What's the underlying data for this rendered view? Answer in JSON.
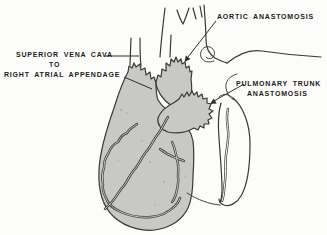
{
  "diagram": {
    "annotations": {
      "aortic": {
        "label": "AORTIC ANASTOMOSIS"
      },
      "svc": {
        "line1": "SUPERIOR VENA CAVA",
        "line2": "TO",
        "line3": "RIGHT ATRIAL APPENDAGE"
      },
      "pulmonary": {
        "line1": "PULMONARY TRUNK",
        "line2": "ANASTOMOSIS"
      }
    },
    "colors": {
      "background": "#fcfcfa",
      "line": "#383838",
      "heart_fill": "#c8c8c5",
      "text": "#1c1c1c"
    }
  }
}
